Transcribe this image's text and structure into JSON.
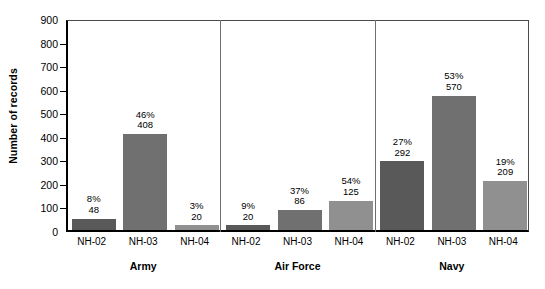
{
  "chart_data": {
    "type": "bar",
    "title": "",
    "xlabel": "",
    "ylabel": "Number of records",
    "ylim": [
      0,
      900
    ],
    "ytick_step": 100,
    "yticks": [
      "900",
      "800",
      "700",
      "600",
      "500",
      "400",
      "300",
      "200",
      "100",
      "0"
    ],
    "grid": false,
    "legend": "none",
    "groups": [
      {
        "name": "Army",
        "bars": [
          {
            "category": "NH-02",
            "value": 48,
            "percent": "8%",
            "value_label": "48",
            "color": "#595959"
          },
          {
            "category": "NH-03",
            "value": 408,
            "percent": "46%",
            "value_label": "408",
            "color": "#707070"
          },
          {
            "category": "NH-04",
            "value": 20,
            "percent": "3%",
            "value_label": "20",
            "color": "#909090"
          }
        ]
      },
      {
        "name": "Air Force",
        "bars": [
          {
            "category": "NH-02",
            "value": 20,
            "percent": "9%",
            "value_label": "20",
            "color": "#595959"
          },
          {
            "category": "NH-03",
            "value": 86,
            "percent": "37%",
            "value_label": "86",
            "color": "#707070"
          },
          {
            "category": "NH-04",
            "value": 125,
            "percent": "54%",
            "value_label": "125",
            "color": "#909090"
          }
        ]
      },
      {
        "name": "Navy",
        "bars": [
          {
            "category": "NH-02",
            "value": 292,
            "percent": "27%",
            "value_label": "292",
            "color": "#595959"
          },
          {
            "category": "NH-03",
            "value": 570,
            "percent": "53%",
            "value_label": "570",
            "color": "#707070"
          },
          {
            "category": "NH-04",
            "value": 209,
            "percent": "19%",
            "value_label": "209",
            "color": "#909090"
          }
        ]
      }
    ]
  },
  "axis": {
    "y_title": "Number of records"
  }
}
